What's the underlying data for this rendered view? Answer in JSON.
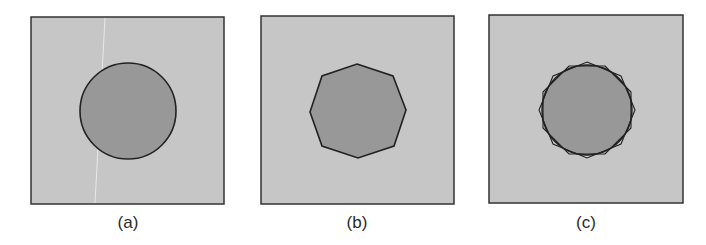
{
  "figure": {
    "colors": {
      "background": "#c6c6c6",
      "shape_fill": "#989898",
      "stroke": "#222222"
    },
    "panels": [
      {
        "label": "(a)",
        "shape": "circle",
        "description": "circle"
      },
      {
        "label": "(b)",
        "shape": "octagon",
        "description": "regular octagon approximation"
      },
      {
        "label": "(c)",
        "shape": "circle-with-octagons",
        "description": "circle overlaid with two rotated octagons"
      }
    ]
  }
}
